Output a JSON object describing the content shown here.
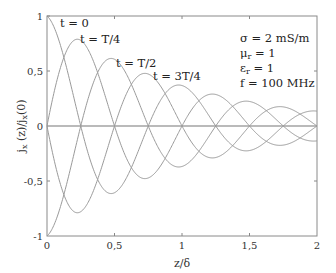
{
  "chart_data": {
    "type": "line",
    "title": "",
    "xlabel": "z/δ",
    "ylabel": "j_x(z)/j_x(0)",
    "xlim": [
      0,
      2
    ],
    "ylim": [
      -1,
      1
    ],
    "grid": false,
    "xticks": [
      0,
      0.5,
      1,
      1.5,
      2
    ],
    "xtick_labels": [
      "0",
      "0,5",
      "1",
      "1,5",
      "2"
    ],
    "yticks": [
      -1,
      -0.5,
      0,
      0.5,
      1
    ],
    "ytick_labels": [
      "-1",
      "-0,5",
      "0",
      "0,5",
      "1"
    ],
    "zero_line": true,
    "model": "y = exp(-x) * cos(phase - 2*pi*x)",
    "series": [
      {
        "name": "t = 0",
        "phase_deg": 0,
        "x": [
          0,
          0.25,
          0.5,
          0.75,
          1,
          1.25,
          1.5,
          1.75,
          2
        ],
        "values": [
          1,
          0,
          -0.61,
          0,
          0.37,
          0,
          -0.22,
          0,
          0.14
        ]
      },
      {
        "name": "t = T/4",
        "phase_deg": 90,
        "x": [
          0,
          0.25,
          0.5,
          0.75,
          1,
          1.25,
          1.5,
          1.75,
          2
        ],
        "values": [
          0,
          0.78,
          0,
          -0.47,
          0,
          0.29,
          0,
          -0.17,
          0
        ]
      },
      {
        "name": "t = T/2",
        "phase_deg": 180,
        "x": [
          0,
          0.25,
          0.5,
          0.75,
          1,
          1.25,
          1.5,
          1.75,
          2
        ],
        "values": [
          -1,
          0,
          0.61,
          0,
          -0.37,
          0,
          0.22,
          0,
          -0.14
        ]
      },
      {
        "name": "t = 3T/4",
        "phase_deg": 270,
        "x": [
          0,
          0.25,
          0.5,
          0.75,
          1,
          1.25,
          1.5,
          1.75,
          2
        ],
        "values": [
          0,
          -0.78,
          0,
          0.47,
          0,
          -0.29,
          0,
          0.17,
          0
        ]
      }
    ],
    "annotations": [
      "σ = 2 mS/m",
      "μr = 1",
      "εr = 1",
      "f = 100 MHz"
    ],
    "line_color": "#9a9a9a",
    "axis_color": "#8a8a8a",
    "zero_line_color": "#777777"
  },
  "labels": {
    "t0": "t = 0",
    "tT4": "t = T/4",
    "tT2": "t = T/2",
    "t3T4": "t = 3T/4"
  },
  "annotation": {
    "sigma": "σ = 2 mS/m",
    "mu_sym": "μ",
    "mu_sub": "r",
    "mu_val": " = 1",
    "eps_sym": "ε",
    "eps_sub": "r",
    "eps_val": " = 1",
    "freq": "f = 100 MHz"
  },
  "axes": {
    "xlabel": "z/δ",
    "ylabel_main": "j",
    "ylabel_sub": "x",
    "ylabel_mid": " (z)/j",
    "ylabel_sub2": "x",
    "ylabel_end": "(0)",
    "x_ticks": [
      "0",
      "0,5",
      "1",
      "1,5",
      "2"
    ],
    "y_ticks": [
      "1",
      "0,5",
      "0",
      "-0,5",
      "-1"
    ]
  }
}
